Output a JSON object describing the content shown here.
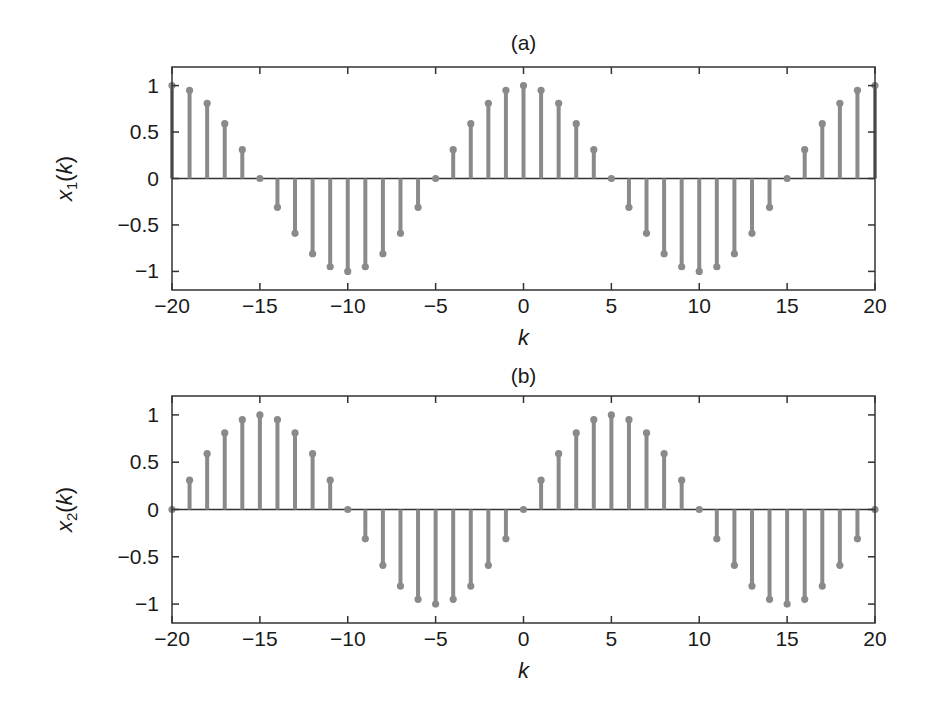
{
  "chart_data": [
    {
      "type": "stem",
      "title": "(a)",
      "xlabel": "k",
      "ylabel": "x1(k)",
      "ylabel_main": "x",
      "ylabel_sub": "1",
      "ylabel_arg": "(k)",
      "xlim": [
        -20,
        20
      ],
      "ylim": [
        -1.2,
        1.2
      ],
      "xticks": [
        -20,
        -15,
        -10,
        -5,
        0,
        5,
        10,
        15,
        20
      ],
      "xtick_labels": [
        "−20",
        "−15",
        "−10",
        "−5",
        "0",
        "5",
        "10",
        "15",
        "20"
      ],
      "yticks": [
        1,
        0.5,
        0,
        -0.5,
        -1
      ],
      "ytick_labels": [
        "1",
        "0.5",
        "0",
        "−0.5",
        "−1"
      ],
      "grid": false,
      "x": [
        -20,
        -19,
        -18,
        -17,
        -16,
        -15,
        -14,
        -13,
        -12,
        -11,
        -10,
        -9,
        -8,
        -7,
        -6,
        -5,
        -4,
        -3,
        -2,
        -1,
        0,
        1,
        2,
        3,
        4,
        5,
        6,
        7,
        8,
        9,
        10,
        11,
        12,
        13,
        14,
        15,
        16,
        17,
        18,
        19,
        20
      ],
      "values": [
        1,
        0.95,
        0.81,
        0.59,
        0.31,
        0,
        -0.31,
        -0.59,
        -0.81,
        -0.95,
        -1,
        -0.95,
        -0.81,
        -0.59,
        -0.31,
        0,
        0.31,
        0.59,
        0.81,
        0.95,
        1,
        0.95,
        0.81,
        0.59,
        0.31,
        0,
        -0.31,
        -0.59,
        -0.81,
        -0.95,
        -1,
        -0.95,
        -0.81,
        -0.59,
        -0.31,
        0,
        0.31,
        0.59,
        0.81,
        0.95,
        1
      ]
    },
    {
      "type": "stem",
      "title": "(b)",
      "xlabel": "k",
      "ylabel": "x2(k)",
      "ylabel_main": "x",
      "ylabel_sub": "2",
      "ylabel_arg": "(k)",
      "xlim": [
        -20,
        20
      ],
      "ylim": [
        -1.2,
        1.2
      ],
      "xticks": [
        -20,
        -15,
        -10,
        -5,
        0,
        5,
        10,
        15,
        20
      ],
      "xtick_labels": [
        "−20",
        "−15",
        "−10",
        "−5",
        "0",
        "5",
        "10",
        "15",
        "20"
      ],
      "yticks": [
        1,
        0.5,
        0,
        -0.5,
        -1
      ],
      "ytick_labels": [
        "1",
        "0.5",
        "0",
        "−0.5",
        "−1"
      ],
      "grid": false,
      "x": [
        -20,
        -19,
        -18,
        -17,
        -16,
        -15,
        -14,
        -13,
        -12,
        -11,
        -10,
        -9,
        -8,
        -7,
        -6,
        -5,
        -4,
        -3,
        -2,
        -1,
        0,
        1,
        2,
        3,
        4,
        5,
        6,
        7,
        8,
        9,
        10,
        11,
        12,
        13,
        14,
        15,
        16,
        17,
        18,
        19,
        20
      ],
      "values": [
        0,
        0.31,
        0.59,
        0.81,
        0.95,
        1,
        0.95,
        0.81,
        0.59,
        0.31,
        0,
        -0.31,
        -0.59,
        -0.81,
        -0.95,
        -1,
        -0.95,
        -0.81,
        -0.59,
        -0.31,
        0,
        0.31,
        0.59,
        0.81,
        0.95,
        1,
        0.95,
        0.81,
        0.59,
        0.31,
        0,
        -0.31,
        -0.59,
        -0.81,
        -0.95,
        -1,
        -0.95,
        -0.81,
        -0.59,
        -0.31,
        0
      ]
    }
  ],
  "style": {
    "stem_color": "#8a8a8a",
    "axis_color": "#333333"
  }
}
